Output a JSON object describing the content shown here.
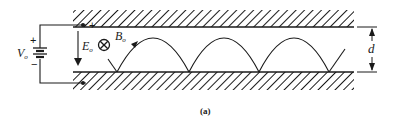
{
  "figure": {
    "caption": "(a)",
    "labels": {
      "voltage": "V",
      "voltage_sub": "o",
      "efield": "E",
      "efield_sub": "o",
      "bfield": "B",
      "bfield_sub": "o",
      "gap": "d",
      "plus": "+",
      "minus": "−"
    },
    "symbols": {
      "bfield_direction": "into-page (⊗)"
    },
    "colors": {
      "ink": "#1a1a1a",
      "background": "#ffffff"
    }
  }
}
